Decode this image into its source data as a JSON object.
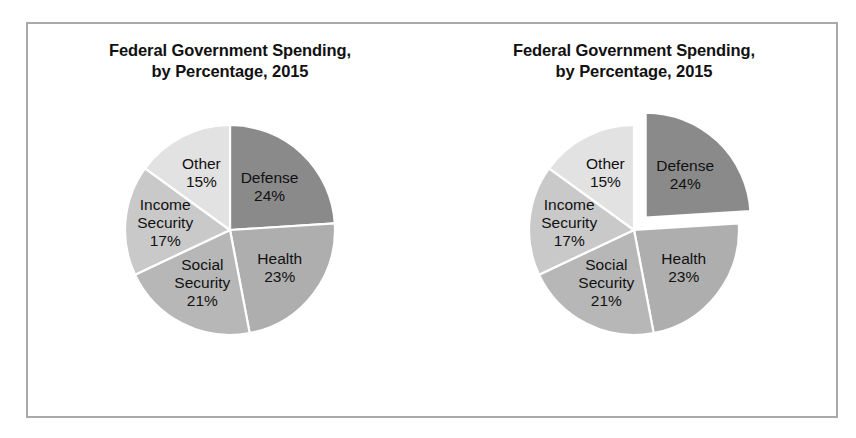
{
  "figure": {
    "background": "#ffffff",
    "frame_border_color": "#a9a9ac",
    "slice_separator_color": "#ffffff"
  },
  "panels": [
    {
      "name": "left-pie-panel",
      "title_line1": "Federal Government Spending,",
      "title_line2": "by Percentage, 2015",
      "exploded": false,
      "exploded_slice": ""
    },
    {
      "name": "right-pie-panel",
      "title_line1": "Federal Government Spending,",
      "title_line2": "by Percentage, 2015",
      "exploded": true,
      "exploded_slice": "Defense"
    }
  ],
  "chart_data": [
    {
      "type": "pie",
      "title": "Federal Government Spending, by Percentage, 2015",
      "xlabel": "",
      "ylabel": "",
      "start_angle_deg": 0,
      "direction": "clockwise",
      "legend": "none",
      "exploded_slices": [],
      "labels": [
        "Defense",
        "Health",
        "Social Security",
        "Income Security",
        "Other"
      ],
      "values": [
        24,
        23,
        21,
        17,
        15
      ],
      "value_labels": [
        "24%",
        "23%",
        "21%",
        "17%",
        "15%"
      ],
      "colors": [
        "#8a8a8a",
        "#aeaeae",
        "#b7b7b7",
        "#c9c9c9",
        "#e2e2e2"
      ]
    },
    {
      "type": "pie",
      "title": "Federal Government Spending, by Percentage, 2015",
      "xlabel": "",
      "ylabel": "",
      "start_angle_deg": 0,
      "direction": "clockwise",
      "legend": "none",
      "exploded_slices": [
        "Defense"
      ],
      "labels": [
        "Defense",
        "Health",
        "Social Security",
        "Income Security",
        "Other"
      ],
      "values": [
        24,
        23,
        21,
        17,
        15
      ],
      "value_labels": [
        "24%",
        "23%",
        "21%",
        "17%",
        "15%"
      ],
      "colors": [
        "#8a8a8a",
        "#aeaeae",
        "#b7b7b7",
        "#c9c9c9",
        "#e2e2e2"
      ]
    }
  ]
}
